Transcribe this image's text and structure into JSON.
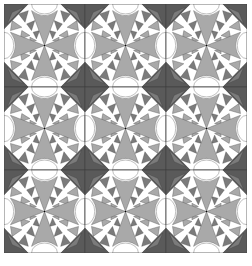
{
  "image": {
    "subject": "quilt-pattern",
    "description": "3x3 grid of identical pieced quilt blocks, each with a four-petal gray cross, white half-circle edges, dark gray corner triangles, and sawtooth triangle fans",
    "grid": {
      "rows": 3,
      "cols": 3
    }
  },
  "colors": {
    "background": "#ffffff",
    "dark": "#5a5a5a",
    "medium": "#a9a9a9",
    "mid_dark": "#7b7b7b",
    "light": "#ffffff",
    "line": "#3a3a3a"
  }
}
